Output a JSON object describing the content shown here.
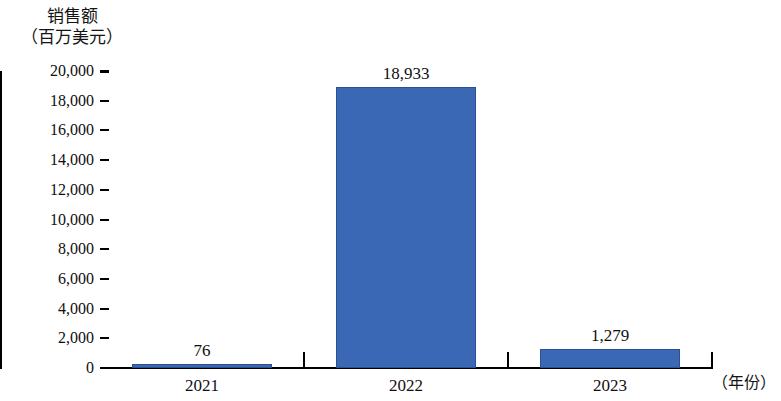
{
  "chart_data": {
    "type": "bar",
    "title": "",
    "categories": [
      "2021",
      "2022",
      "2023"
    ],
    "values": [
      76,
      18933,
      1279
    ],
    "value_labels": [
      "76",
      "18,933",
      "1,279"
    ],
    "series": [
      {
        "name": "销售额",
        "values": [
          76,
          18933,
          1279
        ]
      }
    ],
    "ylabel": "销售额",
    "ylabel_line1": "销售额",
    "ylabel_line2": "（百万美元）",
    "yunit": "百万美元",
    "xlabel": "（年份）",
    "xunit": "年份",
    "ylim": [
      0,
      20000
    ],
    "ytick_step": 2000,
    "ytick_labels": [
      "20,000",
      "18,000",
      "16,000",
      "14,000",
      "12,000",
      "10,000",
      "8,000",
      "6,000",
      "4,000",
      "2,000",
      "0"
    ],
    "ytick_values": [
      20000,
      18000,
      16000,
      14000,
      12000,
      10000,
      8000,
      6000,
      4000,
      2000,
      0
    ],
    "grid": false,
    "legend": false,
    "bar_color": "#3a68b4",
    "bar_edge_color": "#2b4f8f",
    "axis_color": "#000000",
    "background": "#ffffff"
  }
}
